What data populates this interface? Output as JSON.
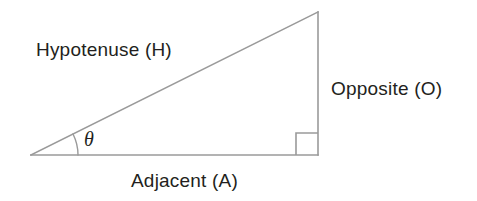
{
  "diagram": {
    "kind": "right-triangle-trigonometry",
    "background_color": "#ffffff",
    "stroke_color": "#9a9a9a",
    "text_color": "#231f20",
    "labels": {
      "hypotenuse": "Hypotenuse (H)",
      "opposite": "Opposite (O)",
      "adjacent": "Adjacent (A)",
      "angle": "θ"
    },
    "geometry": {
      "left_vertex": [
        31,
        155
      ],
      "right_vertex": [
        318,
        155
      ],
      "apex_vertex": [
        318,
        12
      ],
      "right_angle_marker": {
        "x": 296,
        "y": 133,
        "size": 22
      },
      "angle_arc": {
        "center": [
          31,
          155
        ],
        "radius": 47,
        "start_deg": 0,
        "end_deg": 26.5
      }
    }
  }
}
